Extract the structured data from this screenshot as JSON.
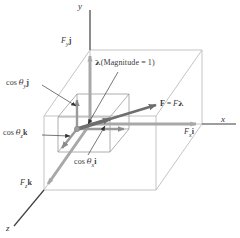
{
  "figure": {
    "background": "#ffffff",
    "colors": {
      "box_line": "#b9b9b9",
      "inner_box_line": "#8e8e8e",
      "axis_line": "#4a4a4a",
      "component_arrow": "#a8a8a8",
      "unit_component_arrow": "#9a9a9a",
      "force_arrow": "#6e6e6e",
      "leader_line": "#3c3c3c",
      "text": "#3a3a3a"
    },
    "axes": [
      {
        "id": "axis-x",
        "label": "x"
      },
      {
        "id": "axis-y",
        "label": "y"
      },
      {
        "id": "axis-z",
        "label": "z"
      }
    ],
    "labels": {
      "force": {
        "bold_f": "F",
        "equals": "=",
        "italic_f": "F",
        "lambda": "λ"
      },
      "lambda_note": {
        "lambda": "λ",
        "text": "(Magnitude = 1)"
      },
      "fy_j": {
        "f": "F",
        "sub": "y",
        "unit": "j"
      },
      "fx_i": {
        "f": "F",
        "sub": "x",
        "unit": "i"
      },
      "fz_k": {
        "f": "F",
        "sub": "z",
        "unit": "k"
      },
      "cos_theta_y": {
        "cos": "cos",
        "theta": "θ",
        "sub": "y",
        "unit": "j"
      },
      "cos_theta_x": {
        "cos": "cos",
        "theta": "θ",
        "sub": "x",
        "unit": "i"
      },
      "cos_theta_z": {
        "cos": "cos",
        "theta": "θ",
        "sub": "z",
        "unit": "k"
      }
    }
  }
}
